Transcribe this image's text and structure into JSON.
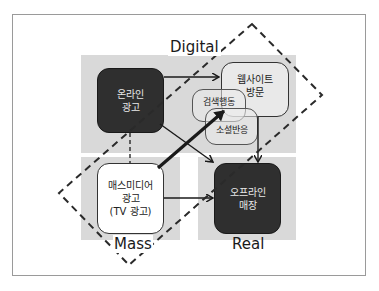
{
  "header": {
    "title_fragment": "디지털과 매스미디어 광고의 상호 작용 구조"
  },
  "diagram": {
    "axis_labels": {
      "top": "Digital",
      "bottom_left": "Mass",
      "bottom_right": "Real"
    },
    "nodes": {
      "online_ad": {
        "line1": "온라인",
        "line2": "광고"
      },
      "website": {
        "line1": "웹사이트",
        "line2": "방문"
      },
      "search": {
        "label": "검색행동"
      },
      "social": {
        "label": "소셜반응"
      },
      "mass_ad": {
        "line1": "매스미디어",
        "line2": "광고",
        "line3": "(TV 광고)"
      },
      "offline_store": {
        "line1": "오프라인",
        "line2": "매장"
      }
    },
    "edges": [
      {
        "from": "online_ad",
        "to": "website",
        "style": "solid"
      },
      {
        "from": "online_ad",
        "to": "offline_store",
        "style": "solid"
      },
      {
        "from": "online_ad",
        "to": "mass_ad",
        "style": "dashed"
      },
      {
        "from": "mass_ad",
        "to": "search",
        "style": "thick"
      },
      {
        "from": "mass_ad",
        "to": "offline_store",
        "style": "solid"
      },
      {
        "from": "website",
        "to": "offline_store",
        "style": "solid"
      }
    ],
    "colors": {
      "panel_gray": "#d9d9d9",
      "dark_node": "#2f2f2f",
      "line": "#1a1a1a"
    }
  }
}
